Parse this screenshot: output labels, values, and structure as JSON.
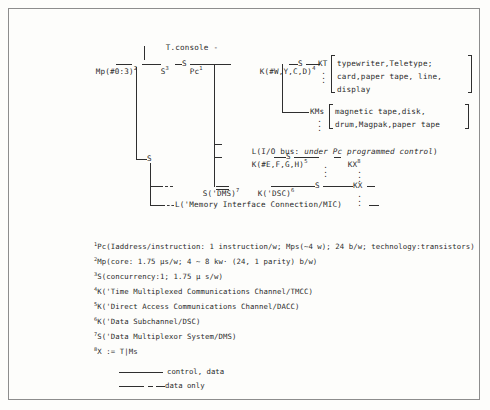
{
  "diagram": {
    "type": "pms-structure-diagram",
    "nodes": {
      "mp_left": "Mp(#0:3)",
      "mp_left_sup": "2",
      "s_zero": "S",
      "s_zero_sup": "3",
      "t_console": "T.console",
      "t_console_dash": "-",
      "pc": "Pc",
      "pc_sup": "1",
      "s_after_pc": "S",
      "k_main": "K(#W,Y,C,D)",
      "k_main_sup": "4",
      "s_after_k": "S",
      "kt": "KT",
      "kt_items": [
        "typewriter,Teletype;",
        "card,paper tape, line,",
        "display"
      ],
      "kms": "KMs",
      "kms_items": [
        "magnetic tape,disk,",
        "drum,Magpak,paper tape"
      ],
      "l_io_bus_plain": "L(I/O bus: ",
      "l_io_bus_italic": "under Pc programmed control",
      "l_io_bus_close": ")",
      "k_fegh": "K(#E,F,G,H)",
      "k_fegh_sup": "5",
      "s_mid": "S",
      "kx_mid": "KX",
      "kx_mid_sup": "8",
      "s_dms": "S('DMS)",
      "s_dms_sup": "7",
      "k_dsc": "K('DSC)",
      "k_dsc_sup": "6",
      "s_low": "S",
      "kx_low": "KX",
      "l_mic": "L('Memory Interface Connection/MIC)"
    }
  },
  "footnotes": [
    {
      "num": "1",
      "text": "Pc(Iaddress/instruction: 1 instruction/w; Mps(~4 w); 24 b/w; technology:transistors)"
    },
    {
      "num": "2",
      "text": "Mp(core: 1.75 μs/w; 4 ~ 8 kw· (24, 1 parity) b/w)"
    },
    {
      "num": "3",
      "text": "S(concurrency:1; 1.75 μ s/w)"
    },
    {
      "num": "4",
      "text": "K('Time Multiplexed Communications Channel/TMCC)"
    },
    {
      "num": "5",
      "text": "K('Direct Access Communications Channel/DACC)"
    },
    {
      "num": "6",
      "text": "K('Data Subchannel/DSC)"
    },
    {
      "num": "7",
      "text": "S('Data Multiplexor System/DMS)"
    },
    {
      "num": "8",
      "text": "X := T|Ms"
    }
  ],
  "legend": [
    {
      "style": "solid",
      "label": "control, data"
    },
    {
      "style": "dashed",
      "label": "data only"
    }
  ],
  "colors": {
    "ink": "#2a2a2a",
    "line": "#2f2f2f",
    "frame": "#8d8d8d",
    "background": "#fdfdfb"
  },
  "vertical_dots": "⋮"
}
